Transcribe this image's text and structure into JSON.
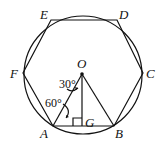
{
  "diagram": {
    "type": "regular hexagon inscribed in circle",
    "vertices": {
      "A": "A",
      "B": "B",
      "C": "C",
      "D": "D",
      "E": "E",
      "F": "F"
    },
    "center": "O",
    "foot": "G",
    "angles": {
      "top": "30°",
      "bottom": "60°"
    },
    "colors": {
      "stroke": "#111111",
      "background": "#ffffff"
    }
  }
}
